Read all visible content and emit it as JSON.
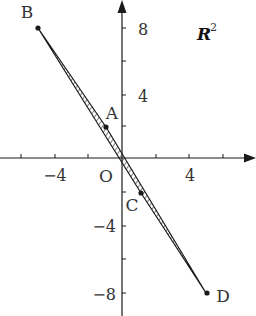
{
  "diagram": {
    "space_label": "R",
    "space_superscript": "2",
    "origin_label": "O",
    "x_axis": {
      "tick_labels": [
        {
          "value": -4,
          "text": "−4"
        },
        {
          "value": 4,
          "text": "4"
        }
      ],
      "minor_ticks": [
        -6,
        -4,
        -2,
        2,
        4,
        6
      ]
    },
    "y_axis": {
      "tick_labels": [
        {
          "value": 8,
          "text": "8"
        },
        {
          "value": 4,
          "text": "4"
        },
        {
          "value": -4,
          "text": "−4"
        },
        {
          "value": -8,
          "text": "−8"
        }
      ],
      "minor_ticks": [
        8,
        6,
        4,
        2,
        -2,
        -4,
        -6,
        -8
      ]
    },
    "points": [
      {
        "name": "B",
        "x": -5,
        "y": 8
      },
      {
        "name": "A",
        "x": -1,
        "y": 2
      },
      {
        "name": "C",
        "x": 1,
        "y": -2
      },
      {
        "name": "D",
        "x": 5,
        "y": -8
      }
    ],
    "shaded_region": "convex hull of A, B, C, D (thin hatched quadrilateral)",
    "colors": {
      "ink": "#1a1a1a",
      "background": "#ffffff"
    }
  }
}
